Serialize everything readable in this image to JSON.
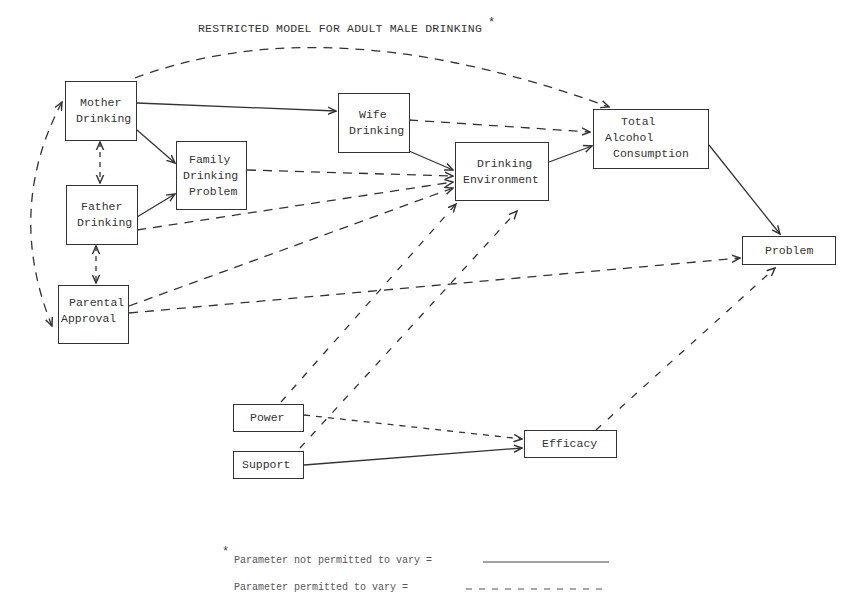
{
  "title": "RESTRICTED MODEL FOR ADULT MALE DRINKING",
  "title_marker": "*",
  "nodes": {
    "mother": {
      "lines": [
        "Mother",
        "Drinking"
      ]
    },
    "father": {
      "lines": [
        "Father",
        "Drinking"
      ]
    },
    "parental": {
      "lines": [
        "Parental",
        "Approval"
      ]
    },
    "family": {
      "lines": [
        "Family",
        "Drinking",
        "Problem"
      ]
    },
    "wife": {
      "lines": [
        "Wife",
        "Drinking"
      ]
    },
    "environment": {
      "lines": [
        "Drinking",
        "Environment"
      ]
    },
    "total": {
      "lines": [
        "Total",
        "Alcohol",
        "Consumption"
      ]
    },
    "problem": {
      "lines": [
        "Problem"
      ]
    },
    "power": {
      "lines": [
        "Power"
      ]
    },
    "support": {
      "lines": [
        "Support"
      ]
    },
    "efficacy": {
      "lines": [
        "Efficacy"
      ]
    }
  },
  "edges": [
    {
      "from": "Mother Drinking",
      "to": "Wife Drinking",
      "style": "solid"
    },
    {
      "from": "Mother Drinking",
      "to": "Family Drinking Problem",
      "style": "solid"
    },
    {
      "from": "Father Drinking",
      "to": "Family Drinking Problem",
      "style": "solid"
    },
    {
      "from": "Mother Drinking",
      "to": "Total Alcohol Consumption",
      "style": "dashed"
    },
    {
      "from": "Mother Drinking",
      "to": "Father Drinking",
      "style": "dashed",
      "bidirectional": true
    },
    {
      "from": "Father Drinking",
      "to": "Parental Approval",
      "style": "dashed",
      "bidirectional": true
    },
    {
      "from": "Mother Drinking",
      "to": "Parental Approval",
      "style": "dashed",
      "bidirectional": true
    },
    {
      "from": "Family Drinking Problem",
      "to": "Drinking Environment",
      "style": "dashed"
    },
    {
      "from": "Father Drinking",
      "to": "Drinking Environment",
      "style": "dashed"
    },
    {
      "from": "Parental Approval",
      "to": "Drinking Environment",
      "style": "dashed"
    },
    {
      "from": "Parental Approval",
      "to": "Problem",
      "style": "dashed"
    },
    {
      "from": "Wife Drinking",
      "to": "Drinking Environment",
      "style": "solid"
    },
    {
      "from": "Wife Drinking",
      "to": "Total Alcohol Consumption",
      "style": "dashed"
    },
    {
      "from": "Drinking Environment",
      "to": "Total Alcohol Consumption",
      "style": "solid"
    },
    {
      "from": "Total Alcohol Consumption",
      "to": "Problem",
      "style": "solid"
    },
    {
      "from": "Power",
      "to": "Drinking Environment",
      "style": "dashed"
    },
    {
      "from": "Support",
      "to": "Drinking Environment",
      "style": "dashed"
    },
    {
      "from": "Power",
      "to": "Efficacy",
      "style": "dashed"
    },
    {
      "from": "Support",
      "to": "Efficacy",
      "style": "solid"
    },
    {
      "from": "Efficacy",
      "to": "Problem",
      "style": "dashed"
    }
  ],
  "legend": {
    "marker": "*",
    "fixed_label": "Parameter not permitted to vary =",
    "free_label": "Parameter permitted to vary ="
  },
  "colors": {
    "line": "#333333",
    "background": "#ffffff"
  }
}
